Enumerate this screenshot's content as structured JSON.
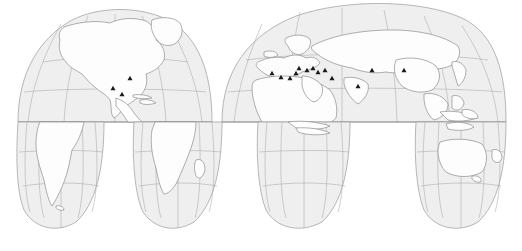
{
  "figure": {
    "projection": "Goode homolosine (interrupted)",
    "background_color": "#ffffff",
    "ocean_color": "#efefef",
    "land_color": "#fdfdfd",
    "graticule_color": "#a8a8a8",
    "outline_color": "#8d8d8d",
    "marker_color": "#1a1a1a",
    "marker_shape": "triangle"
  },
  "graticule": {
    "parallel_spacing_degrees": 30,
    "meridian_spacing_degrees": 30,
    "equator_label": "Equator",
    "equator_y": 122,
    "parallels": [
      30,
      60,
      -30,
      -60
    ],
    "visible": true
  },
  "lobes": {
    "northern": [
      {
        "name": "americas-north-lobe",
        "central_meridian": -100
      },
      {
        "name": "eurasia-africa-north-lobe",
        "central_meridian": 20
      }
    ],
    "southern": [
      {
        "name": "south-america-lobe",
        "central_meridian": -60
      },
      {
        "name": "africa-lobe",
        "central_meridian": 20
      },
      {
        "name": "indian-ocean-lobe",
        "central_meridian": 60
      },
      {
        "name": "australia-lobe",
        "central_meridian": 140
      }
    ]
  },
  "markers": [
    {
      "id": "m01",
      "region": "Gulf of Mexico",
      "x": 130,
      "y": 78
    },
    {
      "id": "m02",
      "region": "Western Mexico",
      "x": 113,
      "y": 88
    },
    {
      "id": "m03",
      "region": "Mesoamerica",
      "x": 122,
      "y": 94
    },
    {
      "id": "m04",
      "region": "Western Mediterranean",
      "x": 272,
      "y": 73
    },
    {
      "id": "m05",
      "region": "Central Mediterranean",
      "x": 281,
      "y": 77
    },
    {
      "id": "m06",
      "region": "Eastern Mediterranean",
      "x": 290,
      "y": 78
    },
    {
      "id": "m07",
      "region": "Levant",
      "x": 296,
      "y": 73
    },
    {
      "id": "m08",
      "region": "Anatolia",
      "x": 299,
      "y": 68
    },
    {
      "id": "m09",
      "region": "Mesopotamia",
      "x": 307,
      "y": 70
    },
    {
      "id": "m10",
      "region": "Caspian region",
      "x": 313,
      "y": 68
    },
    {
      "id": "m11",
      "region": "Iranian plateau",
      "x": 318,
      "y": 72
    },
    {
      "id": "m12",
      "region": "Central Asia",
      "x": 325,
      "y": 70
    },
    {
      "id": "m13",
      "region": "Arabian Sea coast",
      "x": 332,
      "y": 78
    },
    {
      "id": "m14",
      "region": "South Asia",
      "x": 358,
      "y": 86
    },
    {
      "id": "m15",
      "region": "Inner Asia",
      "x": 372,
      "y": 70
    },
    {
      "id": "m16",
      "region": "East Asia",
      "x": 404,
      "y": 70
    }
  ],
  "marker_count": 16
}
